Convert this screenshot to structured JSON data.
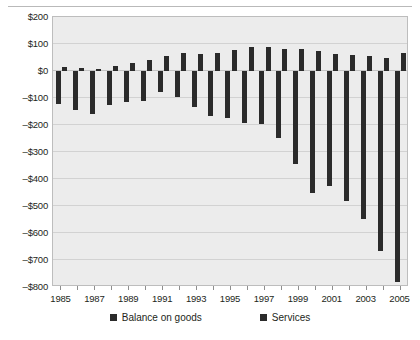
{
  "chart_data": {
    "type": "bar",
    "title": "",
    "subtitle": "",
    "xlabel": "",
    "ylabel": "",
    "grid": true,
    "legend_position": "bottom",
    "ylim": [
      -800,
      200
    ],
    "ytick_labels": [
      "$200",
      "$100",
      "$0",
      "-$100",
      "-$200",
      "-$300",
      "-$400",
      "-$500",
      "-$600",
      "-$700",
      "-$800"
    ],
    "ytick_values": [
      200,
      100,
      0,
      -100,
      -200,
      -300,
      -400,
      -500,
      -600,
      -700,
      -800
    ],
    "categories": [
      "1985",
      "1986",
      "1987",
      "1988",
      "1989",
      "1990",
      "1991",
      "1992",
      "1993",
      "1994",
      "1995",
      "1996",
      "1997",
      "1998",
      "1999",
      "2000",
      "2001",
      "2002",
      "2003",
      "2004",
      "2005"
    ],
    "xtick_labels": [
      "1985",
      "1987",
      "1989",
      "1991",
      "1993",
      "1995",
      "1997",
      "1999",
      "2001",
      "2003",
      "2005"
    ],
    "series": [
      {
        "name": "Balance on goods",
        "color": "#2b2b2b",
        "values": [
          -122,
          -145,
          -160,
          -127,
          -116,
          -111,
          -77,
          -97,
          -133,
          -166,
          -174,
          -191,
          -198,
          -248,
          -346,
          -452,
          -427,
          -483,
          -548,
          -666,
          -782
        ]
      },
      {
        "name": "Services",
        "color": "#2b2b2b",
        "values": [
          15,
          12,
          8,
          17,
          31,
          41,
          57,
          66,
          63,
          68,
          78,
          89,
          90,
          82,
          82,
          75,
          64,
          61,
          54,
          48,
          66
        ]
      }
    ]
  },
  "legend": {
    "items": [
      {
        "label": "Balance on goods"
      },
      {
        "label": "Services"
      }
    ]
  }
}
